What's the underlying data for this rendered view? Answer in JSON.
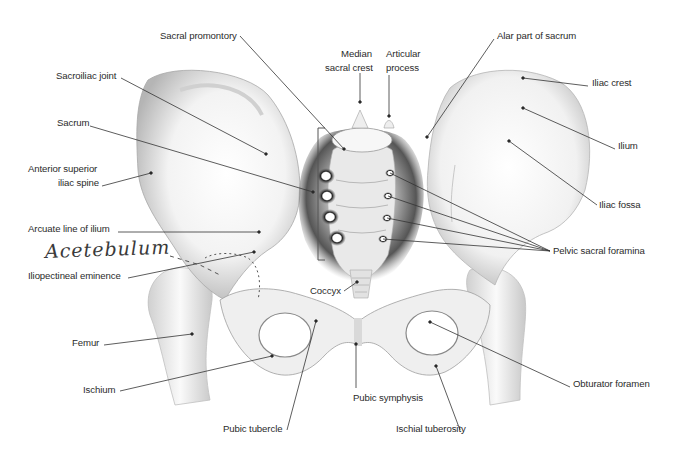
{
  "diagram": {
    "colors": {
      "background": "#ffffff",
      "bone": "#f4f4f4",
      "bone_shade": "#9a9a9a",
      "sacrum_shadow": "#4a4a4a",
      "leader": "#333333",
      "text": "#2b2b2b"
    },
    "labels": [
      {
        "id": "sacral-promontory",
        "text": "Sacral promontory",
        "x": 160,
        "y": 30,
        "align": "left",
        "line": [
          [
            240,
            36
          ],
          [
            344,
            149
          ]
        ]
      },
      {
        "id": "median-sacral-crest-1",
        "text": "Median",
        "x": 341,
        "y": 48,
        "align": "left",
        "line": null
      },
      {
        "id": "median-sacral-crest-2",
        "text": "sacral crest",
        "x": 325,
        "y": 62,
        "align": "left",
        "line": [
          [
            360,
            73
          ],
          [
            360,
            102
          ]
        ]
      },
      {
        "id": "articular-process-1",
        "text": "Articular",
        "x": 386,
        "y": 48,
        "align": "left",
        "line": null
      },
      {
        "id": "articular-process-2",
        "text": "process",
        "x": 386,
        "y": 62,
        "align": "left",
        "line": [
          [
            389,
            75
          ],
          [
            389,
            116
          ]
        ]
      },
      {
        "id": "alar-part-of-sacrum",
        "text": "Alar part of sacrum",
        "x": 497,
        "y": 30,
        "align": "left",
        "line": [
          [
            494,
            39
          ],
          [
            427,
            137
          ]
        ]
      },
      {
        "id": "sacroiliac-joint",
        "text": "Sacroiliac joint",
        "x": 56,
        "y": 70,
        "align": "left",
        "line": [
          [
            121,
            78
          ],
          [
            266,
            154
          ]
        ]
      },
      {
        "id": "iliac-crest",
        "text": "Iliac crest",
        "x": 592,
        "y": 77,
        "align": "left",
        "line": [
          [
            588,
            86
          ],
          [
            523,
            78
          ]
        ]
      },
      {
        "id": "sacrum",
        "text": "Sacrum",
        "x": 57,
        "y": 117,
        "align": "left",
        "line": [
          [
            90,
            126
          ],
          [
            313,
            192
          ]
        ]
      },
      {
        "id": "ilium",
        "text": "Ilium",
        "x": 618,
        "y": 140,
        "align": "left",
        "line": [
          [
            615,
            149
          ],
          [
            523,
            108
          ]
        ]
      },
      {
        "id": "anterior-superior-iliac-spine-1",
        "text": "Anterior superior",
        "x": 28,
        "y": 163,
        "align": "left",
        "line": null
      },
      {
        "id": "anterior-superior-iliac-spine-2",
        "text": "iliac spine",
        "x": 58,
        "y": 177,
        "align": "left",
        "line": [
          [
            102,
            186
          ],
          [
            151,
            173
          ]
        ]
      },
      {
        "id": "iliac-fossa",
        "text": "Iliac fossa",
        "x": 599,
        "y": 199,
        "align": "left",
        "line": [
          [
            597,
            205
          ],
          [
            509,
            141
          ]
        ]
      },
      {
        "id": "arcuate-line-of-ilium",
        "text": "Arcuate line of ilium",
        "x": 28,
        "y": 223,
        "align": "left",
        "line": [
          [
            118,
            232
          ],
          [
            259,
            232
          ]
        ]
      },
      {
        "id": "pelvic-sacral-foramina",
        "text": "Pelvic sacral foramina",
        "x": 553,
        "y": 245,
        "align": "left",
        "line": null
      },
      {
        "id": "iliopectineal-eminence",
        "text": "Iliopectineal eminence",
        "x": 28,
        "y": 270,
        "align": "left",
        "line": [
          [
            128,
            278
          ],
          [
            254,
            252
          ]
        ]
      },
      {
        "id": "coccyx",
        "text": "Coccyx",
        "x": 310,
        "y": 285,
        "align": "left",
        "line": [
          [
            344,
            291
          ],
          [
            357,
            282
          ]
        ]
      },
      {
        "id": "femur",
        "text": "Femur",
        "x": 72,
        "y": 337,
        "align": "left",
        "line": [
          [
            104,
            345
          ],
          [
            192,
            334
          ]
        ]
      },
      {
        "id": "ischium",
        "text": "Ischium",
        "x": 83,
        "y": 384,
        "align": "left",
        "line": [
          [
            120,
            391
          ],
          [
            272,
            356
          ]
        ]
      },
      {
        "id": "obturator-foramen",
        "text": "Obturator foramen",
        "x": 573,
        "y": 378,
        "align": "left",
        "line": [
          [
            570,
            387
          ],
          [
            430,
            322
          ]
        ]
      },
      {
        "id": "pubic-symphysis",
        "text": "Pubic symphysis",
        "x": 353,
        "y": 392,
        "align": "left",
        "line": [
          [
            356,
            388
          ],
          [
            356,
            344
          ]
        ]
      },
      {
        "id": "pubic-tubercle",
        "text": "Pubic tubercle",
        "x": 223,
        "y": 423,
        "align": "left",
        "line": [
          [
            287,
            430
          ],
          [
            316,
            321
          ]
        ]
      },
      {
        "id": "ischial-tuberosity",
        "text": "Ischial tuberosity",
        "x": 396,
        "y": 423,
        "align": "left",
        "line": [
          [
            460,
            430
          ],
          [
            436,
            366
          ]
        ]
      }
    ],
    "foramina_leaders": {
      "anchor": [
        550,
        251
      ],
      "targets": [
        [
          390,
          173
        ],
        [
          388,
          196
        ],
        [
          387,
          218
        ],
        [
          383,
          239
        ]
      ]
    },
    "sacrum_bracket": {
      "x": 318,
      "top": 128,
      "bottom": 260
    },
    "annotation": {
      "text": "Acetebulum",
      "x": 45,
      "y": 240,
      "dashes": "-- ."
    }
  }
}
